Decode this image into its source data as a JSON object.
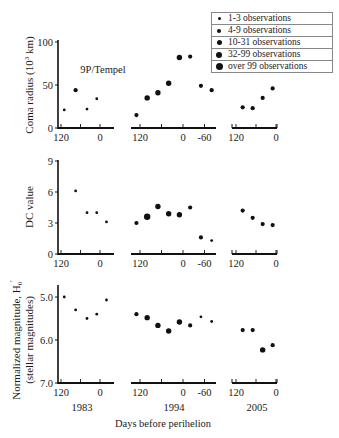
{
  "chart_data": [
    {
      "type": "scatter",
      "panel": "top",
      "title": "9P/Tempel",
      "ylabel": "Coma radius (10^3 km)",
      "ylabel_parts": {
        "main": "Coma radius (10",
        "sup": "3",
        "tail": " km)"
      },
      "ylim": [
        0,
        100
      ],
      "yticks": [
        0,
        50,
        100
      ],
      "xlabel": "Days before perihelion",
      "series": [
        {
          "name": "1983",
          "x_ticks": [
            "120",
            "0"
          ],
          "points": [
            {
              "days": 110,
              "value": 21,
              "size": 1
            },
            {
              "days": 75,
              "value": 44,
              "size": 2
            },
            {
              "days": 40,
              "value": 22,
              "size": 1
            },
            {
              "days": 10,
              "value": 34,
              "size": 1
            }
          ]
        },
        {
          "name": "1994",
          "x_ticks": [
            "120",
            "0",
            "-60"
          ],
          "points": [
            {
              "days": 130,
              "value": 15,
              "size": 2
            },
            {
              "days": 100,
              "value": 35,
              "size": 3
            },
            {
              "days": 70,
              "value": 41,
              "size": 3
            },
            {
              "days": 40,
              "value": 52,
              "size": 3
            },
            {
              "days": 10,
              "value": 82,
              "size": 3
            },
            {
              "days": -20,
              "value": 83,
              "size": 2
            },
            {
              "days": -50,
              "value": 49,
              "size": 2
            },
            {
              "days": -80,
              "value": 44,
              "size": 2
            }
          ]
        },
        {
          "name": "2005",
          "x_ticks": [
            "120",
            "0"
          ],
          "points": [
            {
              "days": 100,
              "value": 24,
              "size": 2
            },
            {
              "days": 70,
              "value": 23,
              "size": 2
            },
            {
              "days": 40,
              "value": 35,
              "size": 2
            },
            {
              "days": 10,
              "value": 46,
              "size": 2
            }
          ]
        }
      ]
    },
    {
      "type": "scatter",
      "panel": "middle",
      "ylabel": "DC value",
      "ylim": [
        0,
        9
      ],
      "yticks": [
        0,
        3,
        6,
        9
      ],
      "xlabel": "Days before perihelion",
      "series": [
        {
          "name": "1983",
          "x_ticks": [
            "120",
            "0"
          ],
          "points": [
            {
              "days": 75,
              "value": 6.1,
              "size": 1
            },
            {
              "days": 40,
              "value": 4.0,
              "size": 1
            },
            {
              "days": 10,
              "value": 4.0,
              "size": 1
            },
            {
              "days": -20,
              "value": 3.1,
              "size": 1
            }
          ]
        },
        {
          "name": "1994",
          "x_ticks": [
            "120",
            "0",
            "-60"
          ],
          "points": [
            {
              "days": 130,
              "value": 3.0,
              "size": 2
            },
            {
              "days": 100,
              "value": 3.6,
              "size": 4
            },
            {
              "days": 70,
              "value": 4.6,
              "size": 3
            },
            {
              "days": 40,
              "value": 3.9,
              "size": 3
            },
            {
              "days": 10,
              "value": 3.8,
              "size": 3
            },
            {
              "days": -20,
              "value": 4.5,
              "size": 2
            },
            {
              "days": -50,
              "value": 1.6,
              "size": 2
            },
            {
              "days": -80,
              "value": 1.3,
              "size": 1
            }
          ]
        },
        {
          "name": "2005",
          "x_ticks": [
            "120",
            "0"
          ],
          "points": [
            {
              "days": 100,
              "value": 4.2,
              "size": 2
            },
            {
              "days": 70,
              "value": 3.5,
              "size": 2
            },
            {
              "days": 40,
              "value": 2.9,
              "size": 2
            },
            {
              "days": 10,
              "value": 2.8,
              "size": 2
            }
          ]
        }
      ]
    },
    {
      "type": "scatter",
      "panel": "bottom",
      "ylabel": "Normalized magnitude, H0' (stellar magnitudes)",
      "ylabel_line1": "Normalized magnitude, H",
      "ylabel_line1_sub": "0",
      "ylabel_line1_sup": "'",
      "ylabel_line2": "(stellar magnitudes)",
      "ylim": [
        7.0,
        5.0
      ],
      "y_inverted": true,
      "yticks": [
        "5.0",
        "6.0",
        "7.0"
      ],
      "xlabel": "Days before perihelion",
      "series": [
        {
          "name": "1983",
          "x_ticks": [
            "120",
            "0"
          ],
          "points": [
            {
              "days": 110,
              "value": 5.0,
              "size": 1
            },
            {
              "days": 75,
              "value": 5.3,
              "size": 1
            },
            {
              "days": 40,
              "value": 5.5,
              "size": 1
            },
            {
              "days": 10,
              "value": 5.4,
              "size": 1
            },
            {
              "days": -20,
              "value": 5.07,
              "size": 1
            }
          ]
        },
        {
          "name": "1994",
          "x_ticks": [
            "120",
            "0",
            "-60"
          ],
          "points": [
            {
              "days": 130,
              "value": 5.4,
              "size": 2
            },
            {
              "days": 100,
              "value": 5.48,
              "size": 3
            },
            {
              "days": 70,
              "value": 5.66,
              "size": 3
            },
            {
              "days": 40,
              "value": 5.79,
              "size": 3
            },
            {
              "days": 10,
              "value": 5.58,
              "size": 3
            },
            {
              "days": -20,
              "value": 5.66,
              "size": 2
            },
            {
              "days": -50,
              "value": 5.46,
              "size": 1
            },
            {
              "days": -80,
              "value": 5.57,
              "size": 1
            }
          ]
        },
        {
          "name": "2005",
          "x_ticks": [
            "120",
            "0"
          ],
          "points": [
            {
              "days": 100,
              "value": 5.77,
              "size": 2
            },
            {
              "days": 70,
              "value": 5.77,
              "size": 2
            },
            {
              "days": 40,
              "value": 6.23,
              "size": 3
            },
            {
              "days": 10,
              "value": 6.12,
              "size": 2
            }
          ]
        }
      ]
    }
  ],
  "years": [
    "1983",
    "1994",
    "2005"
  ],
  "xlabel": "Days before perihelion",
  "legend": [
    {
      "label": "1-3 observations",
      "size": 1
    },
    {
      "label": "4-9 observations",
      "size": 2
    },
    {
      "label": "10-31 observations",
      "size": 3
    },
    {
      "label": "32-99 observations",
      "size": 4
    },
    {
      "label": "over 99 observations",
      "size": 5
    }
  ],
  "marker_radius": {
    "1": 1.4,
    "2": 2.1,
    "3": 2.7,
    "4": 3.2,
    "5": 3.8
  },
  "colors": {
    "ink": "#111111",
    "axis": "#111111",
    "legend_border": "#888888"
  }
}
